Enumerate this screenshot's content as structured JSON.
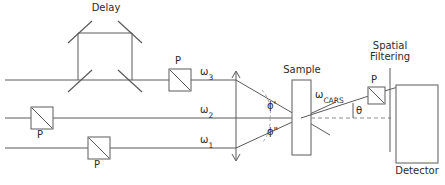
{
  "diagram": {
    "labels": {
      "delay": "Delay",
      "sample": "Sample",
      "spatial_filtering_line1": "Spatial",
      "spatial_filtering_line2": "Filtering",
      "detector": "Detector",
      "polarizer": "P",
      "omega3_base": "ω",
      "omega3_sub": "3",
      "omega2_base": "ω",
      "omega2_sub": "2",
      "omega1_base": "ω",
      "omega1_sub": "1",
      "omega_cars_base": "ω",
      "omega_cars_sub": "CARS",
      "phi_prime": "ϕ'",
      "phi_double_prime": "ϕ\"",
      "theta": "θ"
    },
    "components": [
      {
        "name": "delay-line",
        "type": "mirror-assembly",
        "label": "Delay",
        "mirror_count": 4
      },
      {
        "name": "polarizer-omega3",
        "type": "polarizer",
        "label": "P",
        "beam": "ω3"
      },
      {
        "name": "polarizer-omega2",
        "type": "polarizer",
        "label": "P",
        "beam": "ω2"
      },
      {
        "name": "polarizer-omega1",
        "type": "polarizer",
        "label": "P",
        "beam": "ω1"
      },
      {
        "name": "sample",
        "type": "cell",
        "label": "Sample"
      },
      {
        "name": "spatial-filter",
        "type": "slit",
        "label": "Spatial Filtering"
      },
      {
        "name": "polarizer-analyzer",
        "type": "polarizer",
        "label": "P",
        "beam": "ωCARS"
      },
      {
        "name": "detector",
        "type": "detector",
        "label": "Detector"
      }
    ],
    "beams": [
      {
        "name": "omega3",
        "label": "ω3",
        "y": 80,
        "role": "upper pump beam, passes through delay line"
      },
      {
        "name": "omega2",
        "label": "ω2",
        "y": 118,
        "role": "central beam"
      },
      {
        "name": "omega1",
        "label": "ω1",
        "y": 148,
        "role": "lower beam"
      },
      {
        "name": "omega_cars",
        "label": "ωCARS",
        "role": "generated anti-Stokes signal exiting at angle θ"
      }
    ],
    "angles": [
      {
        "name": "phi-prime",
        "symbol": "ϕ'",
        "between": [
          "ω3",
          "ω2"
        ]
      },
      {
        "name": "phi-double-prime",
        "symbol": "ϕ\"",
        "between": [
          "ω2",
          "ω1"
        ]
      },
      {
        "name": "theta",
        "symbol": "θ",
        "between": [
          "ωCARS",
          "optical axis"
        ]
      }
    ],
    "colors": {
      "line": "#5a5a5a",
      "box_stroke": "#6a6a6a",
      "dashed": "#8a8a8a",
      "arc": "#9a9a9a",
      "text": "#2b2b2b",
      "background": "#ffffff"
    }
  }
}
